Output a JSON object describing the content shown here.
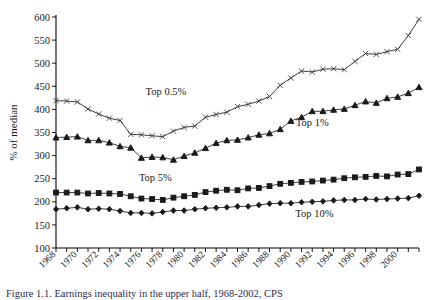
{
  "figure": {
    "ylabel": "% of median",
    "xlabel": "",
    "caption": "Figure 1.1. Earnings inequality in the upper half, 1968-2002, CPS"
  },
  "chart_data": {
    "type": "line",
    "title": "",
    "xlabel": "",
    "ylabel": "% of median",
    "ylim": [
      100,
      600
    ],
    "ytick_step": 50,
    "yticks": [
      100,
      150,
      200,
      250,
      300,
      350,
      400,
      450,
      500,
      550,
      600
    ],
    "xlim": [
      1968,
      2002
    ],
    "xticks_labeled": [
      1968,
      1970,
      1972,
      1974,
      1976,
      1978,
      1980,
      1982,
      1984,
      1986,
      1988,
      1990,
      1992,
      1994,
      1996,
      1998,
      2000
    ],
    "xtick_every": 1,
    "grid": false,
    "legend_position": "inline-annotations",
    "x": [
      1968,
      1969,
      1970,
      1971,
      1972,
      1973,
      1974,
      1975,
      1976,
      1977,
      1978,
      1979,
      1980,
      1981,
      1982,
      1983,
      1984,
      1985,
      1986,
      1987,
      1988,
      1989,
      1990,
      1991,
      1992,
      1993,
      1994,
      1995,
      1996,
      1997,
      1998,
      1999,
      2000,
      2001,
      2002
    ],
    "series": [
      {
        "name": "Top 0.5%",
        "marker": "x",
        "label": "Top 0.5%",
        "values": [
          419,
          418,
          416,
          401,
          390,
          381,
          376,
          346,
          345,
          343,
          341,
          353,
          361,
          364,
          383,
          389,
          394,
          406,
          411,
          418,
          428,
          452,
          468,
          483,
          481,
          487,
          488,
          486,
          504,
          521,
          519,
          525,
          530,
          560,
          595
        ]
      },
      {
        "name": "Top 1%",
        "marker": "triangle",
        "label": "Top 1%",
        "values": [
          339,
          340,
          341,
          333,
          333,
          328,
          320,
          317,
          295,
          297,
          296,
          291,
          299,
          306,
          316,
          327,
          333,
          334,
          339,
          345,
          348,
          357,
          375,
          383,
          396,
          396,
          399,
          401,
          409,
          417,
          414,
          424,
          427,
          435,
          448
        ]
      },
      {
        "name": "Top 5%",
        "marker": "square",
        "label": "Top 5%",
        "values": [
          220,
          220,
          220,
          218,
          219,
          218,
          217,
          212,
          207,
          206,
          204,
          209,
          212,
          215,
          221,
          224,
          226,
          225,
          229,
          230,
          234,
          239,
          241,
          243,
          244,
          246,
          248,
          251,
          253,
          254,
          256,
          255,
          259,
          260,
          270
        ]
      },
      {
        "name": "Top 10%",
        "marker": "diamond",
        "label": "Top 10%",
        "values": [
          184,
          186,
          188,
          184,
          185,
          184,
          180,
          176,
          176,
          175,
          178,
          181,
          181,
          184,
          186,
          187,
          188,
          190,
          190,
          193,
          196,
          197,
          197,
          199,
          200,
          201,
          203,
          204,
          204,
          206,
          205,
          206,
          207,
          208,
          213
        ]
      }
    ],
    "annotations": [
      {
        "text": "Top 0.5%",
        "x": 1978.3,
        "y": 432
      },
      {
        "text": "Top 1%",
        "x": 1992.0,
        "y": 365
      },
      {
        "text": "Top 5%",
        "x": 1977.3,
        "y": 246
      },
      {
        "text": "Top 10%",
        "x": 1992.2,
        "y": 168
      }
    ]
  }
}
